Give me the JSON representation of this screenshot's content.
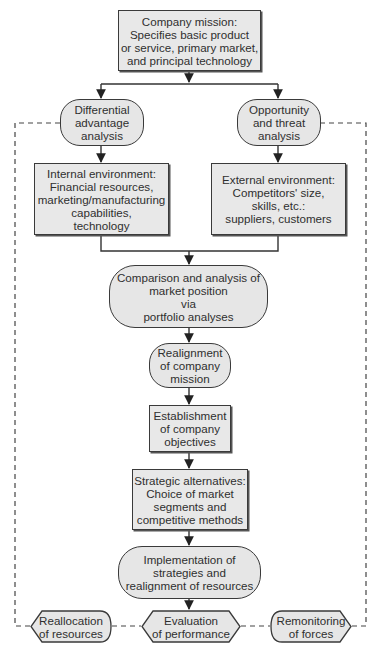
{
  "diagram": {
    "type": "flowchart",
    "nodes": {
      "mission": {
        "shape": "rectangle",
        "lines": [
          "Company mission:",
          "Specifies basic product",
          "or service, primary market,",
          "and principal technology"
        ]
      },
      "differential": {
        "shape": "rounded",
        "lines": [
          "Differential",
          "advantage",
          "analysis"
        ]
      },
      "opportunity": {
        "shape": "rounded",
        "lines": [
          "Opportunity",
          "and threat",
          "analysis"
        ]
      },
      "internal": {
        "shape": "rectangle",
        "lines": [
          "Internal environment:",
          "Financial resources,",
          "marketing/manufacturing",
          "capabilities,",
          "technology"
        ]
      },
      "external": {
        "shape": "rectangle",
        "lines": [
          "External environment:",
          "Competitors' size,",
          "skills, etc.:",
          "suppliers, customers"
        ]
      },
      "comparison": {
        "shape": "rounded",
        "lines": [
          "Comparison and analysis of",
          "market position",
          "via",
          "portfolio analyses"
        ]
      },
      "realignment": {
        "shape": "rounded",
        "lines": [
          "Realignment",
          "of company",
          "mission"
        ]
      },
      "objectives": {
        "shape": "rectangle",
        "lines": [
          "Establishment",
          "of company",
          "objectives"
        ]
      },
      "strategic": {
        "shape": "rectangle",
        "lines": [
          "Strategic alternatives:",
          "Choice of market",
          "segments and",
          "competitive methods"
        ]
      },
      "implementation": {
        "shape": "rounded",
        "lines": [
          "Implementation of",
          "strategies and",
          "realignment of resources"
        ]
      },
      "reallocation": {
        "shape": "hexagon-left",
        "lines": [
          "Reallocation",
          "of resources"
        ]
      },
      "evaluation": {
        "shape": "hexagon",
        "lines": [
          "Evaluation",
          "of performance"
        ]
      },
      "remonitoring": {
        "shape": "hexagon-right",
        "lines": [
          "Remonitoring",
          "of forces"
        ]
      }
    },
    "edges": [
      {
        "from": "mission",
        "to": "differential",
        "style": "solid"
      },
      {
        "from": "mission",
        "to": "opportunity",
        "style": "solid"
      },
      {
        "from": "differential",
        "to": "internal",
        "style": "solid"
      },
      {
        "from": "opportunity",
        "to": "external",
        "style": "solid"
      },
      {
        "from": "internal",
        "to": "comparison",
        "style": "solid"
      },
      {
        "from": "external",
        "to": "comparison",
        "style": "solid"
      },
      {
        "from": "comparison",
        "to": "realignment",
        "style": "solid"
      },
      {
        "from": "realignment",
        "to": "objectives",
        "style": "solid"
      },
      {
        "from": "objectives",
        "to": "strategic",
        "style": "solid"
      },
      {
        "from": "strategic",
        "to": "implementation",
        "style": "solid"
      },
      {
        "from": "implementation",
        "to": "evaluation",
        "style": "solid"
      },
      {
        "from": "evaluation",
        "to": "reallocation",
        "style": "dashed"
      },
      {
        "from": "evaluation",
        "to": "remonitoring",
        "style": "dashed"
      },
      {
        "from": "reallocation",
        "to": "differential",
        "style": "dashed"
      },
      {
        "from": "remonitoring",
        "to": "opportunity",
        "style": "dashed"
      }
    ],
    "colors": {
      "fill": "#e6e6e6",
      "stroke": "#3a3a3a",
      "text": "#2f2f2f",
      "background": "#ffffff"
    }
  }
}
